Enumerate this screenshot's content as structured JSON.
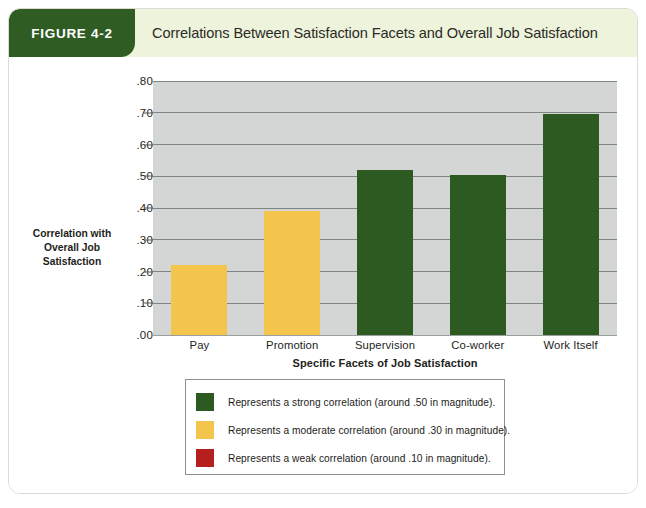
{
  "figure": {
    "tag": "FIGURE 4-2",
    "title": "Correlations Between Satisfaction Facets and Overall Job Satisfaction"
  },
  "chart_data": {
    "type": "bar",
    "title": "Correlations Between Satisfaction Facets and Overall Job Satisfaction",
    "categories": [
      "Pay",
      "Promotion",
      "Supervision",
      "Co-worker",
      "Work Itself"
    ],
    "values": [
      0.22,
      0.39,
      0.52,
      0.505,
      0.695
    ],
    "value_labels": [
      ".22",
      ".39",
      ".52",
      ".50",
      ".70"
    ],
    "bar_colors": [
      "#f4c54c",
      "#f4c54c",
      "#2c5a20",
      "#2c5a20",
      "#2c5a20"
    ],
    "xlabel": "Specific Facets of Job Satisfaction",
    "ylabel": "Correlation with Overall Job Satisfaction",
    "ylabel_lines": [
      "Correlation with",
      "Overall Job",
      "Satisfaction"
    ],
    "ylim": [
      0.0,
      0.8
    ],
    "yticks": [
      0.0,
      0.1,
      0.2,
      0.3,
      0.4,
      0.5,
      0.6,
      0.7,
      0.8
    ],
    "ytick_labels": [
      ".00",
      ".10",
      ".20",
      ".30",
      ".40",
      ".50",
      ".60",
      ".70",
      ".80"
    ],
    "grid": true,
    "legend_position": "below",
    "plot_background": "#d3d6d5",
    "legend": [
      {
        "color": "#2c5a20",
        "label": "Represents a strong correlation (around .50 in magnitude)."
      },
      {
        "color": "#f4c54c",
        "label": "Represents a moderate correlation (around .30 in magnitude)."
      },
      {
        "color": "#b5201e",
        "label": "Represents a weak correlation (around .10 in magnitude)."
      }
    ]
  },
  "colors": {
    "header_band": "#eef3dc",
    "tag_green": "#2e5c22",
    "strong": "#2c5a20",
    "moderate": "#f4c54c",
    "weak": "#b5201e"
  }
}
